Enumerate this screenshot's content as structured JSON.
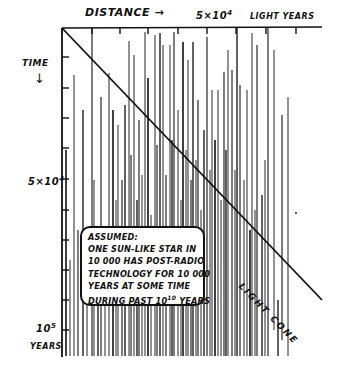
{
  "diagram": {
    "x_axis": {
      "title": "DISTANCE →",
      "mid_label": "5×10",
      "mid_label_exp": "4",
      "unit_label": "LIGHT YEARS",
      "ticks_x": [
        62,
        92,
        120,
        148,
        178,
        207,
        236,
        266,
        296
      ]
    },
    "y_axis": {
      "title": "TIME",
      "arrow": "↓",
      "mid_label": "5×10",
      "mid_label_exp": "4",
      "end_label": "10",
      "end_label_exp": "5",
      "end_unit": "YEARS",
      "ticks_y": [
        57,
        88,
        118,
        148,
        179,
        210,
        240,
        270,
        300,
        330
      ]
    },
    "light_cone": {
      "label": "LIGHT CONE",
      "x1": 62,
      "y1": 28,
      "x2": 322,
      "y2": 300
    },
    "note": {
      "lines": [
        "ASSUMED:",
        "ONE SUN-LIKE STAR IN",
        "10 000 HAS POST-RADIO",
        "TECHNOLOGY FOR 10 000",
        "YEARS AT SOME TIME",
        "DURING PAST 10",
        "10",
        " YEARS"
      ]
    },
    "signal_lines": [
      {
        "x": 66,
        "top": 150,
        "bottom": 356
      },
      {
        "x": 70,
        "top": 260,
        "bottom": 356
      },
      {
        "x": 74,
        "top": 75,
        "bottom": 356
      },
      {
        "x": 78,
        "top": 230,
        "bottom": 356
      },
      {
        "x": 83,
        "top": 110,
        "bottom": 356
      },
      {
        "x": 87,
        "top": 300,
        "bottom": 356
      },
      {
        "x": 92,
        "top": 28,
        "bottom": 356
      },
      {
        "x": 94,
        "top": 180,
        "bottom": 356
      },
      {
        "x": 98,
        "top": 240,
        "bottom": 356
      },
      {
        "x": 101,
        "top": 97,
        "bottom": 356
      },
      {
        "x": 105,
        "top": 275,
        "bottom": 356
      },
      {
        "x": 109,
        "top": 73,
        "bottom": 356
      },
      {
        "x": 113,
        "top": 110,
        "bottom": 356
      },
      {
        "x": 116,
        "top": 200,
        "bottom": 356
      },
      {
        "x": 118,
        "top": 125,
        "bottom": 356
      },
      {
        "x": 122,
        "top": 180,
        "bottom": 356
      },
      {
        "x": 125,
        "top": 105,
        "bottom": 356
      },
      {
        "x": 129,
        "top": 41,
        "bottom": 356
      },
      {
        "x": 131,
        "top": 155,
        "bottom": 356
      },
      {
        "x": 134,
        "top": 55,
        "bottom": 356
      },
      {
        "x": 137,
        "top": 200,
        "bottom": 356
      },
      {
        "x": 139,
        "top": 120,
        "bottom": 356
      },
      {
        "x": 142,
        "top": 175,
        "bottom": 356
      },
      {
        "x": 145,
        "top": 32,
        "bottom": 356
      },
      {
        "x": 148,
        "top": 78,
        "bottom": 356
      },
      {
        "x": 151,
        "top": 215,
        "bottom": 356
      },
      {
        "x": 155,
        "top": 35,
        "bottom": 356
      },
      {
        "x": 157,
        "top": 145,
        "bottom": 356
      },
      {
        "x": 160,
        "top": 33,
        "bottom": 356
      },
      {
        "x": 163,
        "top": 45,
        "bottom": 356
      },
      {
        "x": 166,
        "top": 175,
        "bottom": 356
      },
      {
        "x": 170,
        "top": 45,
        "bottom": 356
      },
      {
        "x": 172,
        "top": 140,
        "bottom": 356
      },
      {
        "x": 174,
        "top": 32,
        "bottom": 356
      },
      {
        "x": 178,
        "top": 110,
        "bottom": 356
      },
      {
        "x": 181,
        "top": 200,
        "bottom": 356
      },
      {
        "x": 183,
        "top": 42,
        "bottom": 356
      },
      {
        "x": 186,
        "top": 150,
        "bottom": 356
      },
      {
        "x": 188,
        "top": 60,
        "bottom": 356
      },
      {
        "x": 191,
        "top": 180,
        "bottom": 356
      },
      {
        "x": 193,
        "top": 42,
        "bottom": 356
      },
      {
        "x": 196,
        "top": 160,
        "bottom": 356
      },
      {
        "x": 198,
        "top": 100,
        "bottom": 356
      },
      {
        "x": 201,
        "top": 210,
        "bottom": 356
      },
      {
        "x": 204,
        "top": 130,
        "bottom": 356
      },
      {
        "x": 207,
        "top": 37,
        "bottom": 356
      },
      {
        "x": 210,
        "top": 170,
        "bottom": 356
      },
      {
        "x": 212,
        "top": 90,
        "bottom": 356
      },
      {
        "x": 215,
        "top": 140,
        "bottom": 356
      },
      {
        "x": 218,
        "top": 90,
        "bottom": 356
      },
      {
        "x": 221,
        "top": 200,
        "bottom": 356
      },
      {
        "x": 224,
        "top": 72,
        "bottom": 356
      },
      {
        "x": 226,
        "top": 150,
        "bottom": 356
      },
      {
        "x": 228,
        "top": 50,
        "bottom": 356
      },
      {
        "x": 232,
        "top": 70,
        "bottom": 356
      },
      {
        "x": 235,
        "top": 170,
        "bottom": 356
      },
      {
        "x": 237,
        "top": 28,
        "bottom": 356
      },
      {
        "x": 240,
        "top": 85,
        "bottom": 356
      },
      {
        "x": 244,
        "top": 180,
        "bottom": 356
      },
      {
        "x": 247,
        "top": 90,
        "bottom": 356
      },
      {
        "x": 250,
        "top": 230,
        "bottom": 356
      },
      {
        "x": 252,
        "top": 33,
        "bottom": 356
      },
      {
        "x": 255,
        "top": 210,
        "bottom": 356
      },
      {
        "x": 257,
        "top": 45,
        "bottom": 356
      },
      {
        "x": 262,
        "top": 195,
        "bottom": 356
      },
      {
        "x": 265,
        "top": 160,
        "bottom": 356
      },
      {
        "x": 268,
        "top": 28,
        "bottom": 356
      },
      {
        "x": 274,
        "top": 50,
        "bottom": 330
      },
      {
        "x": 278,
        "top": 300,
        "bottom": 356
      },
      {
        "x": 282,
        "top": 115,
        "bottom": 340
      },
      {
        "x": 288,
        "top": 97,
        "bottom": 356
      }
    ],
    "colors": {
      "ink": "#111111",
      "paper": "#ffffff",
      "line_gray": "#3a3a3a"
    }
  }
}
